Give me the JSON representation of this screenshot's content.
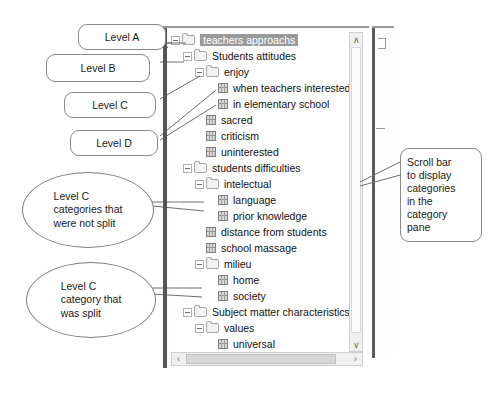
{
  "figure": {
    "tree_panel": {
      "name": "category-pane",
      "selected_node": "teachers approachs",
      "nodes": [
        {
          "label": "teachers approachs",
          "level": 0,
          "type": "folder",
          "expander": "minus",
          "selected": true
        },
        {
          "label": "Students attitudes",
          "level": 1,
          "type": "folder",
          "expander": "minus",
          "selected": false
        },
        {
          "label": "enjoy",
          "level": 2,
          "type": "folder",
          "expander": "minus",
          "selected": false
        },
        {
          "label": "when teachers interested then",
          "level": 3,
          "type": "leaf",
          "expander": "none",
          "selected": false
        },
        {
          "label": "in elementary school",
          "level": 3,
          "type": "leaf",
          "expander": "none",
          "selected": false
        },
        {
          "label": "sacred",
          "level": 2,
          "type": "leaf",
          "expander": "none",
          "selected": false
        },
        {
          "label": "criticism",
          "level": 2,
          "type": "leaf",
          "expander": "none",
          "selected": false
        },
        {
          "label": "uninterested",
          "level": 2,
          "type": "leaf",
          "expander": "none",
          "selected": false
        },
        {
          "label": "students difficulties",
          "level": 1,
          "type": "folder",
          "expander": "minus",
          "selected": false
        },
        {
          "label": "intelectual",
          "level": 2,
          "type": "folder",
          "expander": "minus",
          "selected": false
        },
        {
          "label": "language",
          "level": 3,
          "type": "leaf",
          "expander": "none",
          "selected": false
        },
        {
          "label": "prior knowledge",
          "level": 3,
          "type": "leaf",
          "expander": "none",
          "selected": false
        },
        {
          "label": "distance from students",
          "level": 2,
          "type": "leaf",
          "expander": "none",
          "selected": false
        },
        {
          "label": "school massage",
          "level": 2,
          "type": "leaf",
          "expander": "none",
          "selected": false
        },
        {
          "label": "milieu",
          "level": 2,
          "type": "folder",
          "expander": "minus",
          "selected": false
        },
        {
          "label": "home",
          "level": 3,
          "type": "leaf",
          "expander": "none",
          "selected": false
        },
        {
          "label": "society",
          "level": 3,
          "type": "leaf",
          "expander": "none",
          "selected": false
        },
        {
          "label": "Subject matter characteristics",
          "level": 1,
          "type": "folder",
          "expander": "minus",
          "selected": false
        },
        {
          "label": "values",
          "level": 2,
          "type": "folder",
          "expander": "minus",
          "selected": false
        },
        {
          "label": "universal",
          "level": 3,
          "type": "leaf",
          "expander": "none",
          "selected": false
        },
        {
          "label": "particularistic",
          "level": 3,
          "type": "leaf",
          "expander": "none",
          "selected": false
        },
        {
          "label": "knowlege",
          "level": 2,
          "type": "folder",
          "expander": "minus",
          "selected": false
        },
        {
          "label": "specific",
          "level": 3,
          "type": "leaf",
          "expander": "none",
          "selected": false
        },
        {
          "label": "general",
          "level": 3,
          "type": "leaf",
          "expander": "none",
          "selected": false
        }
      ],
      "scrollbars": {
        "vertical": {
          "up_arrow": "∧",
          "down_arrow": "∨"
        },
        "horizontal": {
          "left_arrow": "‹",
          "right_arrow": "›"
        }
      }
    },
    "annotations": {
      "level_a": "Level A",
      "level_b": "Level B",
      "level_c": "Level C",
      "level_d": "Level D",
      "scrollbar_note": "Scroll bar\nto display\ncategories\nin the\ncategory\npane",
      "not_split_note": "Level C\ncategories that\nwere not split",
      "was_split_note": "Level C\ncategory that\nwas split"
    },
    "colors": {
      "selection": "#9a9a9a",
      "callout_border": "#8a8a8a",
      "splitter": "#555555",
      "panel_background": "#fdfdfd"
    }
  }
}
